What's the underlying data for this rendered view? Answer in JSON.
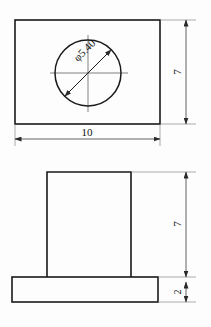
{
  "drawing": {
    "title": "Orthographic Part Drawing",
    "background_color": "#fdfdfd",
    "line_color": "#1a1a1a",
    "views": [
      {
        "name": "top-view",
        "label": "Top View",
        "shape": "rectangle-with-circular-hole",
        "width_value": "10",
        "height_value": "7",
        "hole_label": "φ5.40"
      },
      {
        "name": "front-view",
        "label": "Front View",
        "shape": "tee-profile",
        "upper_height_value": "7",
        "base_height_value": "2"
      }
    ]
  },
  "dimensions": {
    "top_width": "10",
    "top_height": "7",
    "hole_diameter": "φ5.40",
    "front_upper_height": "7",
    "front_base_height": "2"
  },
  "icons": {
    "arrow": "arrow-head",
    "diameter_symbol": "φ"
  }
}
